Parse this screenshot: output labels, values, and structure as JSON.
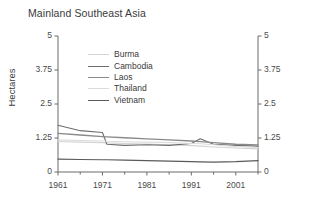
{
  "chart_data": {
    "type": "line",
    "title": "Mainland Southeast Asia",
    "xlabel": "",
    "ylabel": "Hectares",
    "xlim": [
      1961,
      2006
    ],
    "ylim": [
      0,
      5
    ],
    "yticks": [
      "0",
      "1.25",
      "2.5",
      "3.75",
      "5"
    ],
    "ytick_values": [
      0,
      1.25,
      2.5,
      3.75,
      5
    ],
    "xticks": [
      "1961",
      "1971",
      "1981",
      "1991",
      "2001"
    ],
    "xtick_values": [
      1961,
      1971,
      1981,
      1991,
      2001
    ],
    "minor_xtick_values": [
      1966,
      1976,
      1986,
      1996,
      2006
    ],
    "grid": false,
    "legend_position": "top-left-inside",
    "dual_y_axis": true,
    "x": [
      1961,
      1966,
      1971,
      1972,
      1976,
      1981,
      1986,
      1991,
      1993,
      1996,
      2001,
      2006
    ],
    "series": [
      {
        "name": "Burma",
        "color": "#d4d4d4",
        "width": 1.1,
        "values": [
          1.12,
          1.1,
          1.08,
          1.07,
          1.05,
          1.03,
          1.0,
          0.97,
          0.95,
          0.92,
          0.88,
          0.85
        ]
      },
      {
        "name": "Cambodia",
        "color": "#6e6e6e",
        "width": 1.1,
        "values": [
          1.72,
          1.52,
          1.45,
          1.02,
          0.98,
          1.0,
          0.98,
          1.05,
          1.22,
          1.02,
          0.98,
          0.95
        ]
      },
      {
        "name": "Laos",
        "color": "#8a8a8a",
        "width": 1.3,
        "values": [
          1.42,
          1.36,
          1.3,
          1.29,
          1.26,
          1.22,
          1.18,
          1.14,
          1.12,
          1.08,
          1.02,
          1.0
        ]
      },
      {
        "name": "Thailand",
        "color": "#dcdcdc",
        "width": 1.1,
        "values": [
          1.18,
          1.16,
          1.14,
          1.13,
          1.11,
          1.1,
          1.08,
          1.05,
          1.04,
          1.0,
          0.94,
          0.9
        ]
      },
      {
        "name": "Vietnam",
        "color": "#5a5a5a",
        "width": 1.2,
        "values": [
          0.47,
          0.46,
          0.45,
          0.45,
          0.44,
          0.42,
          0.4,
          0.38,
          0.37,
          0.36,
          0.38,
          0.42
        ]
      }
    ]
  },
  "axes": {
    "left_ticks": [
      "5",
      "3.75",
      "2.5",
      "1.25",
      "0"
    ],
    "right_ticks": [
      "5",
      "3.75",
      "2.5",
      "1.25",
      "0"
    ],
    "bottom_ticks": [
      "1961",
      "1971",
      "1981",
      "1991",
      "2001"
    ]
  },
  "legend": {
    "items": [
      {
        "label": "Burma",
        "color": "#d4d4d4"
      },
      {
        "label": "Cambodia",
        "color": "#6e6e6e"
      },
      {
        "label": "Laos",
        "color": "#8a8a8a"
      },
      {
        "label": "Thailand",
        "color": "#dcdcdc"
      },
      {
        "label": "Vietnam",
        "color": "#5a5a5a"
      }
    ]
  },
  "style": {
    "axis_color": "#6a6a6a",
    "text_color": "#3a3a3a",
    "background": "#ffffff"
  }
}
